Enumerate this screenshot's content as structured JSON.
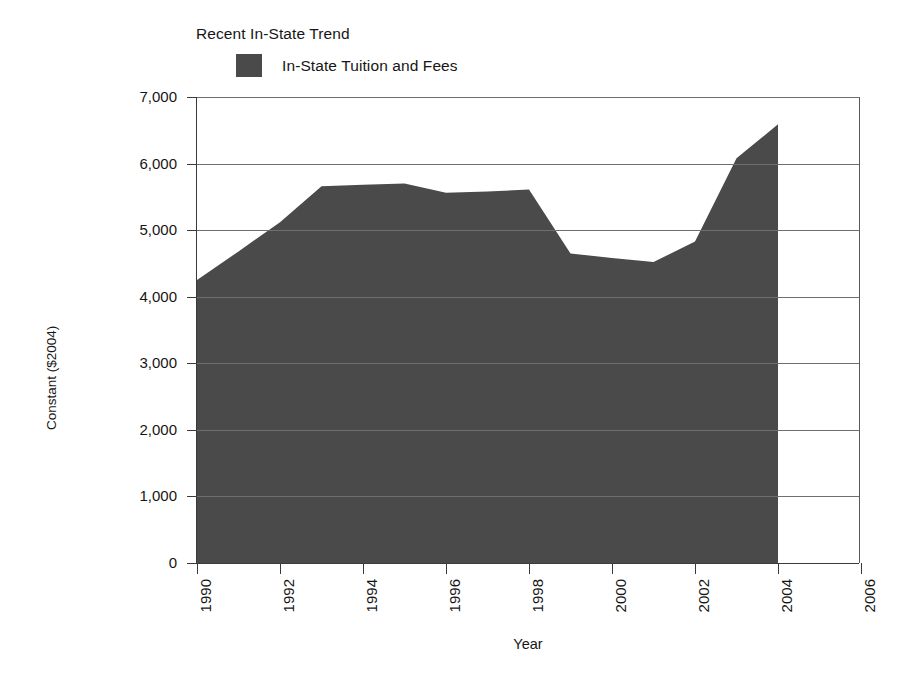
{
  "chart_data": {
    "type": "area",
    "title": "Recent In-State Trend",
    "xlabel": "Year",
    "ylabel": "Constant ($2004)",
    "xlim": [
      1990,
      2006
    ],
    "ylim": [
      0,
      7000
    ],
    "grid": true,
    "legend_position": "top",
    "series": [
      {
        "name": "In-State Tuition and Fees",
        "color": "#4a4a4a",
        "x": [
          1990,
          1991,
          1992,
          1993,
          1994,
          1995,
          1996,
          1997,
          1998,
          1999,
          2000,
          2001,
          2002,
          2003,
          2004
        ],
        "values": [
          4250,
          4680,
          5120,
          5660,
          5680,
          5700,
          5560,
          5580,
          5610,
          4650,
          4580,
          4520,
          4830,
          6080,
          6590
        ]
      }
    ],
    "x_ticks": [
      1990,
      1992,
      1994,
      1996,
      1998,
      2000,
      2002,
      2004,
      2006
    ],
    "x_tick_labels": [
      "1990",
      "1992",
      "1994",
      "1996",
      "1998",
      "2000",
      "2002",
      "2004",
      "2006"
    ],
    "y_ticks": [
      0,
      1000,
      2000,
      3000,
      4000,
      5000,
      6000,
      7000
    ],
    "y_tick_labels": [
      "0",
      "1,000",
      "2,000",
      "3,000",
      "4,000",
      "5,000",
      "6,000",
      "7,000"
    ]
  },
  "legend": {
    "entries": [
      {
        "label": "In-State Tuition and Fees",
        "color": "#4a4a4a"
      }
    ]
  },
  "colors": {
    "series_fill": "#4a4a4a",
    "axis": "#3a3a3a",
    "grid": "#6f6f6f",
    "background": "#ffffff"
  }
}
